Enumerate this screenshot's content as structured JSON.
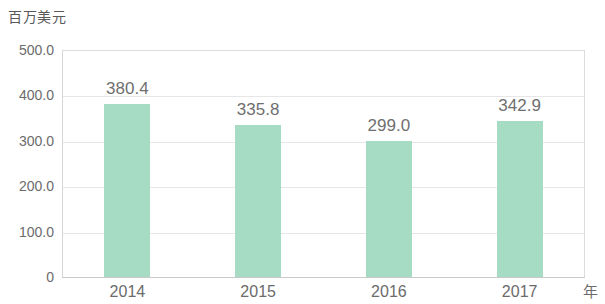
{
  "chart_data": {
    "type": "bar",
    "title": "",
    "subtitle": "",
    "xlabel": "年",
    "ylabel": "百万美元",
    "categories": [
      "2014",
      "2015",
      "2016",
      "2017"
    ],
    "values": [
      380.4,
      335.8,
      299.0,
      342.9
    ],
    "value_labels": [
      "380.4",
      "335.8",
      "299.0",
      "342.9"
    ],
    "ylim": [
      0,
      500
    ],
    "yticks": [
      500,
      400,
      300,
      200,
      100,
      0
    ],
    "ytick_labels": [
      "500.0",
      "400.0",
      "300.0",
      "200.0",
      "100.0",
      "0"
    ],
    "grid": true,
    "grid_axis": "y",
    "legend": false,
    "legend_position": "none",
    "series": [
      {
        "name": "",
        "values": [
          380.4,
          335.8,
          299.0,
          342.9
        ],
        "color": "#a5dcc3"
      }
    ],
    "colors": {
      "bar": "#a5dcc3",
      "gridline": "#e6e6e6",
      "axis": "#c9c9c9",
      "tick_text": "#6b6b6b",
      "label_text": "#6f6f6f",
      "background": "#ffffff"
    }
  }
}
